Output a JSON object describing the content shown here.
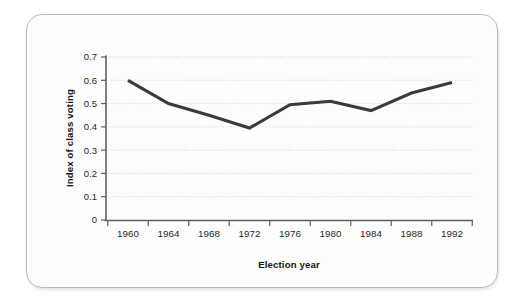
{
  "figure": {
    "card_border_color": "#b9bcbe",
    "background_color": "#fdfdfd"
  },
  "chart_data": {
    "type": "line",
    "title": "",
    "subtitle": "",
    "xlabel": "Election year",
    "ylabel": "Index of class voting",
    "x": [
      1960,
      1964,
      1968,
      1972,
      1976,
      1980,
      1984,
      1988,
      1992
    ],
    "categories": [
      "1960",
      "1964",
      "1968",
      "1972",
      "1976",
      "1980",
      "1984",
      "1988",
      "1992"
    ],
    "values": [
      0.6,
      0.5,
      0.45,
      0.395,
      0.495,
      0.51,
      0.47,
      0.545,
      0.59
    ],
    "series": [
      {
        "name": "Index of class voting",
        "values": [
          0.6,
          0.5,
          0.45,
          0.395,
          0.495,
          0.51,
          0.47,
          0.545,
          0.59
        ],
        "color": "#3a3a3c"
      }
    ],
    "xlim": [
      1958,
      1994
    ],
    "ylim": [
      0,
      0.7
    ],
    "y_ticks": [
      0,
      0.1,
      0.2,
      0.3,
      0.4,
      0.5,
      0.6,
      0.7
    ],
    "y_tick_labels": [
      "0",
      "0.1",
      "0.2",
      "0.3",
      "0.4",
      "0.5",
      "0.6",
      "0.7"
    ],
    "x_ticks": [
      1960,
      1964,
      1968,
      1972,
      1976,
      1980,
      1984,
      1988,
      1992
    ],
    "x_tick_labels": [
      "1960",
      "1964",
      "1968",
      "1972",
      "1976",
      "1980",
      "1984",
      "1988",
      "1992"
    ],
    "grid": true,
    "grid_axis": "y",
    "grid_style": "dotted",
    "legend": false,
    "legend_position": "none",
    "line_color": "#3a3a3c",
    "markers": false,
    "annotations": []
  }
}
